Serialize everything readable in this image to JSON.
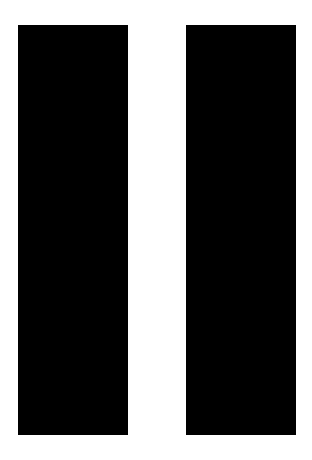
{
  "icon": {
    "semantic": "pause-icon",
    "bar_count": 2,
    "bar_color": "#000000",
    "background_color": "#ffffff"
  }
}
